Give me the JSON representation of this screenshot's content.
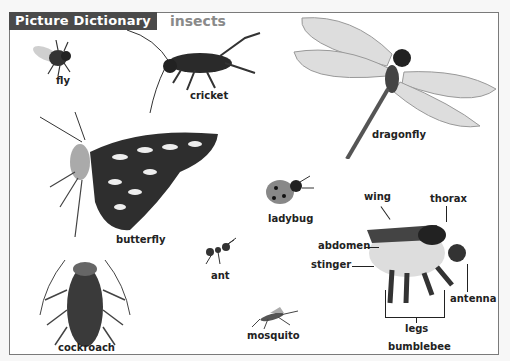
{
  "header": {
    "title": "Picture Dictionary",
    "topic": "insects"
  },
  "insects": {
    "fly": "fly",
    "cricket": "cricket",
    "dragonfly": "dragonfly",
    "butterfly": "butterfly",
    "ladybug": "ladybug",
    "ant": "ant",
    "cockroach": "cockroach",
    "mosquito": "mosquito",
    "bumblebee": "bumblebee"
  },
  "bumblebee_parts": {
    "wing": "wing",
    "thorax": "thorax",
    "abdomen": "abdomen",
    "stinger": "stinger",
    "antenna": "antenna",
    "legs": "legs"
  }
}
